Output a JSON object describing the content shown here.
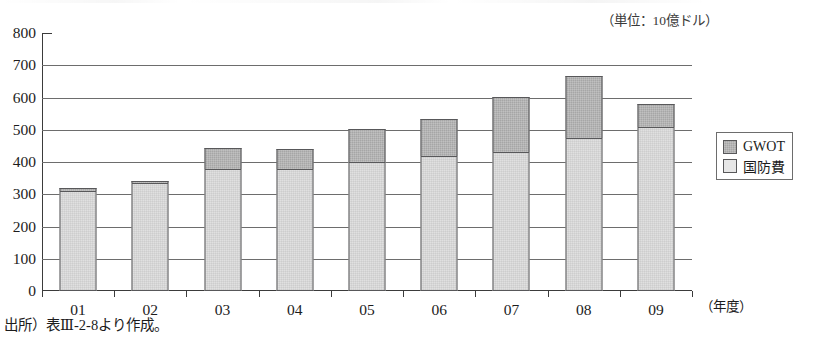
{
  "figure": {
    "partial_title": "",
    "unit_caption": "（単位：10億ドル）",
    "xaxis_title": "（年度）",
    "source_note": "出所）表Ⅲ-2-8より作成。"
  },
  "legend": {
    "items": [
      {
        "label": "GWOT",
        "color": "#a6a6a6"
      },
      {
        "label": "国防費",
        "color": "#e6e6e6"
      }
    ]
  },
  "chart_data": {
    "type": "bar",
    "stacked": true,
    "title": "",
    "subtitle": "（単位：10億ドル）",
    "xlabel": "（年度）",
    "ylabel": "",
    "unit": "10億ドル",
    "categories": [
      "01",
      "02",
      "03",
      "04",
      "05",
      "06",
      "07",
      "08",
      "09"
    ],
    "series": [
      {
        "name": "国防費",
        "color": "#e6e6e6",
        "values": [
          310,
          335,
          378,
          378,
          400,
          420,
          432,
          475,
          510
        ]
      },
      {
        "name": "GWOT",
        "color": "#a6a6a6",
        "values": [
          10,
          5,
          65,
          62,
          103,
          114,
          170,
          192,
          70
        ]
      }
    ],
    "totals": [
      320,
      340,
      443,
      440,
      503,
      534,
      602,
      667,
      580
    ],
    "ylim": [
      0,
      800
    ],
    "yticks": [
      0,
      100,
      200,
      300,
      400,
      500,
      600,
      700,
      800
    ],
    "ytick_labels": [
      "0",
      "100",
      "200",
      "300",
      "400",
      "500",
      "600",
      "700",
      "800"
    ],
    "grid": true,
    "legend_position": "right"
  }
}
